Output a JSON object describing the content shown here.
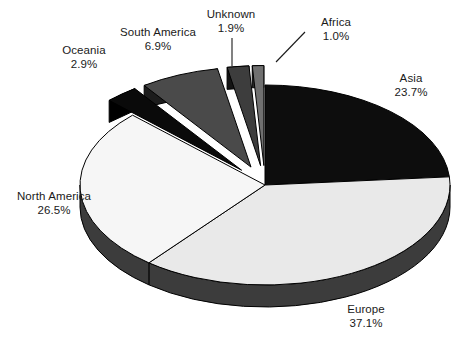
{
  "chart_data": {
    "type": "pie",
    "title": "",
    "subtitle": "",
    "xlabel": "",
    "ylabel": "",
    "legend_position": "none",
    "grid": false,
    "style": "3d-exploded-grayscale",
    "value_unit": "%",
    "total": 100.0,
    "categories": [
      "Asia",
      "Europe",
      "North America",
      "Oceania",
      "South America",
      "Unknown",
      "Africa"
    ],
    "values": [
      23.7,
      37.1,
      26.5,
      2.9,
      6.9,
      1.9,
      1.0
    ],
    "labels": [
      "Asia 23.7%",
      "Europe 37.1%",
      "North America 26.5%",
      "Oceania 2.9%",
      "South America 6.9%",
      "Unknown 1.9%",
      "Africa 1.0%"
    ],
    "slices": [
      {
        "name": "Asia",
        "value": 23.7,
        "value_text": "23.7%",
        "color": "#0d0d0d",
        "side_color": "#000000",
        "exploded": false,
        "start_angle": 0.0,
        "end_angle": 85.32
      },
      {
        "name": "Europe",
        "value": 37.1,
        "value_text": "37.1%",
        "color": "#e9e9e9",
        "side_color": "#3c3c3c",
        "exploded": false,
        "start_angle": 85.32,
        "end_angle": 218.88
      },
      {
        "name": "North America",
        "value": 26.5,
        "value_text": "26.5%",
        "color": "#f6f6f6",
        "side_color": "#3c3c3c",
        "exploded": false,
        "start_angle": 218.88,
        "end_angle": 314.28
      },
      {
        "name": "Oceania",
        "value": 2.9,
        "value_text": "2.9%",
        "color": "#0a0a0a",
        "side_color": "#000000",
        "exploded": true,
        "start_angle": 314.28,
        "end_angle": 324.72
      },
      {
        "name": "South America",
        "value": 6.9,
        "value_text": "6.9%",
        "color": "#4a4a4a",
        "side_color": "#1c1c1c",
        "exploded": true,
        "start_angle": 324.72,
        "end_angle": 349.56
      },
      {
        "name": "Unknown",
        "value": 1.9,
        "value_text": "1.9%",
        "color": "#3d3d3d",
        "side_color": "#141414",
        "exploded": true,
        "start_angle": 349.56,
        "end_angle": 356.4
      },
      {
        "name": "Africa",
        "value": 1.0,
        "value_text": "1.0%",
        "color": "#707070",
        "side_color": "#2a2a2a",
        "exploded": true,
        "start_angle": 356.4,
        "end_angle": 360.0
      }
    ],
    "leader_lines": [
      {
        "for": "Unknown",
        "from_x": 232,
        "from_y": 38,
        "to_x": 232,
        "to_y": 66
      },
      {
        "for": "Africa",
        "from_x": 305,
        "from_y": 32,
        "to_x": 276,
        "to_y": 62
      }
    ],
    "colors": {
      "background": "#ffffff",
      "outline": "#000000",
      "text": "#1a1a1a",
      "rim": "#3c3c3c"
    }
  },
  "labels": {
    "asia": {
      "name": "Asia",
      "value": "23.7%"
    },
    "europe": {
      "name": "Europe",
      "value": "37.1%"
    },
    "north_america": {
      "name": "North America",
      "value": "26.5%"
    },
    "oceania": {
      "name": "Oceania",
      "value": "2.9%"
    },
    "south_america": {
      "name": "South America",
      "value": "6.9%"
    },
    "unknown": {
      "name": "Unknown",
      "value": "1.9%"
    },
    "africa": {
      "name": "Africa",
      "value": "1.0%"
    }
  }
}
